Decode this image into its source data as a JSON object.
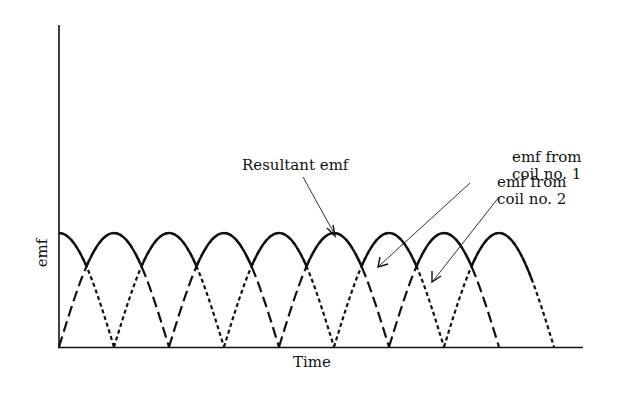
{
  "figure": {
    "axes": {
      "xlabel": "Time",
      "ylabel": "emf"
    },
    "annotations": {
      "resultant": "Resultant emf",
      "coil1_line1": "emf  from",
      "coil1_line2": "coil no. 1",
      "coil2_line1": "emf  from",
      "coil2_line2": "coil no. 2"
    },
    "colors": {
      "ink": "#111111",
      "background": "#ffffff"
    }
  },
  "chart_data": {
    "type": "line",
    "title": "",
    "xlabel": "Time",
    "ylabel": "emf",
    "grid": false,
    "note": "Rectified sinusoidal emfs of two coils 90 degrees apart and the resultant (upper envelope). Units arbitrary; half-period = 2 units.",
    "series": [
      {
        "name": "emf from coil no. 1",
        "style": "long-dash",
        "x": [
          0,
          1,
          2,
          3,
          4,
          5,
          6,
          7,
          8
        ],
        "values": [
          0,
          1,
          0,
          1,
          0,
          1,
          0,
          1,
          0
        ]
      },
      {
        "name": "emf from coil no. 2",
        "style": "short-dash",
        "x": [
          0,
          1,
          2,
          3,
          4,
          5,
          6,
          7,
          8,
          9
        ],
        "values": [
          1,
          0,
          1,
          0,
          1,
          0,
          1,
          0,
          1,
          0
        ]
      },
      {
        "name": "Resultant emf",
        "style": "solid",
        "description": "upper envelope of the two rectified emfs; ripples between 1.0 (peaks) and ~0.71 (crossovers)",
        "x": [
          0,
          0.5,
          1,
          1.5,
          2,
          2.5,
          3,
          3.5,
          4,
          4.5,
          5,
          5.5,
          6,
          6.5,
          7,
          7.5,
          8
        ],
        "values": [
          1,
          0.71,
          1,
          0.71,
          1,
          0.71,
          1,
          0.71,
          1,
          0.71,
          1,
          0.71,
          1,
          0.71,
          1,
          0.71,
          1
        ]
      }
    ],
    "xlim": [
      0,
      9.2
    ],
    "ylim": [
      0,
      2.8
    ]
  }
}
